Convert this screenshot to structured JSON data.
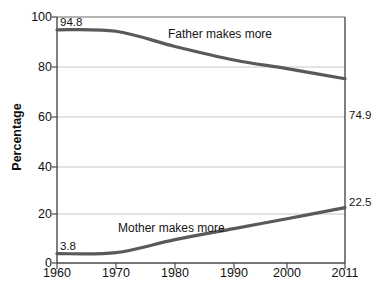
{
  "chart_data": {
    "type": "line",
    "title": "",
    "subtitle": "",
    "xlabel": "",
    "ylabel": "Percentage",
    "xlim": [
      1960,
      2011
    ],
    "ylim": [
      0,
      100
    ],
    "grid": true,
    "legend_position": "inline-annotation",
    "x_tick_labels": [
      "1960",
      "1970",
      "1980",
      "1990",
      "2000",
      "2011"
    ],
    "x_ticks": [
      1960,
      1970,
      1980,
      1990,
      2000,
      2011
    ],
    "y_tick_labels": [
      "0",
      "20",
      "40",
      "60",
      "80",
      "100"
    ],
    "y_ticks": [
      0,
      20,
      40,
      60,
      80,
      100
    ],
    "series": [
      {
        "name": "Father makes more",
        "color": "#595959",
        "x": [
          1960,
          1970,
          1980,
          1990,
          2000,
          2011
        ],
        "values": [
          94.8,
          94.2,
          88.0,
          82.5,
          79.0,
          74.9
        ],
        "start_label": "94.8",
        "end_label": "74.9",
        "annotation": "Father makes more"
      },
      {
        "name": "Mother makes more",
        "color": "#595959",
        "x": [
          1960,
          1970,
          1980,
          1990,
          2000,
          2011
        ],
        "values": [
          3.8,
          4.2,
          9.5,
          14.0,
          18.0,
          22.5
        ],
        "start_label": "3.8",
        "end_label": "22.5",
        "annotation": "Mother makes more"
      }
    ]
  },
  "axes": {
    "y_title": "Percentage",
    "y_labels": [
      "100",
      "80",
      "60",
      "40",
      "20",
      "0"
    ],
    "x_labels": [
      "1960",
      "1970",
      "1980",
      "1990",
      "2000",
      "2011"
    ]
  },
  "annotations": {
    "father_series_label": "Father makes more",
    "mother_series_label": "Mother makes more",
    "father_start_value": "94.8",
    "father_end_value": "74.9",
    "mother_start_value": "3.8",
    "mother_end_value": "22.5"
  },
  "colors": {
    "line": "#595959",
    "grid": "#c8c8c8",
    "axis": "#4a4a4a",
    "text": "#111111",
    "background": "#ffffff"
  }
}
